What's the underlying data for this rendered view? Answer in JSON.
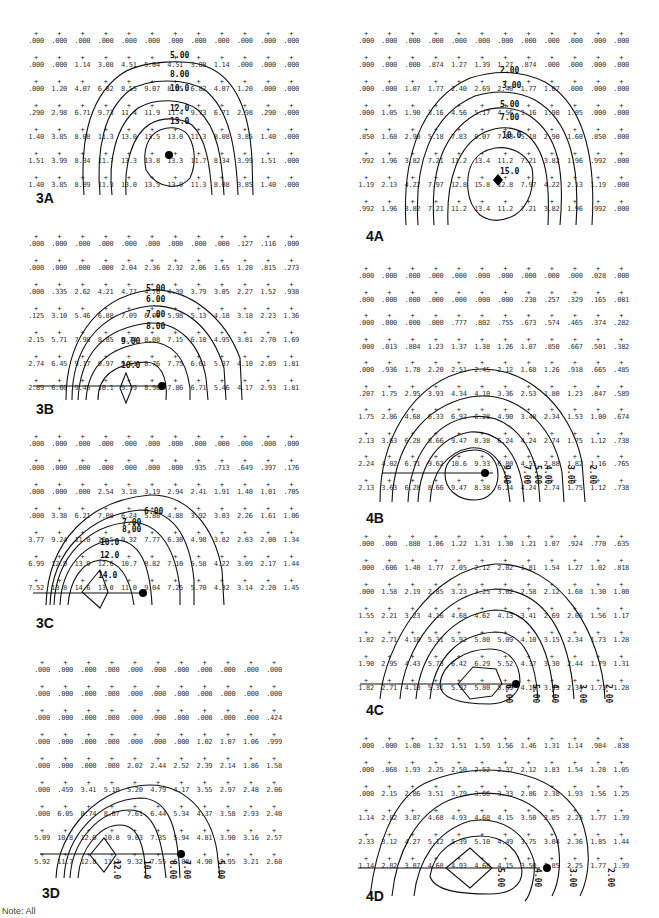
{
  "figure": {
    "footnote": "Note: All"
  },
  "chart_data": [
    {
      "type": "heatmap",
      "id": "3A",
      "title": "3A",
      "contour_levels": [
        "5.00",
        "8.00",
        "10.0",
        "12.0",
        "13.0"
      ],
      "grid": [
        [
          ".000",
          ".000",
          ".000",
          ".000",
          ".000",
          ".000",
          ".000",
          ".000",
          ".000",
          ".000",
          ".000",
          ".000"
        ],
        [
          ".000",
          ".000",
          "1.14",
          "3.08",
          "4.51",
          "5.04",
          "4.51",
          "3.08",
          "1.14",
          ".000",
          ".000",
          ".000"
        ],
        [
          ".000",
          "1.20",
          "4.07",
          "6.82",
          "8.55",
          "9.07",
          "8.55",
          "6.82",
          "4.07",
          "1.20",
          ".000",
          ".000"
        ],
        [
          ".290",
          "2.98",
          "6.71",
          "9.73",
          "11.4",
          "11.9",
          "11.4",
          "9.73",
          "6.71",
          "2.98",
          ".290",
          ".000"
        ],
        [
          "1.40",
          "3.85",
          "8.08",
          "11.3",
          "13.0",
          "13.5",
          "13.0",
          "11.3",
          "8.08",
          "3.85",
          "1.40",
          ".000"
        ],
        [
          "1.51",
          "3.99",
          "8.34",
          "11.7",
          "13.3",
          "13.8",
          "13.3",
          "11.7",
          "8.34",
          "3.99",
          "1.51",
          ".000"
        ],
        [
          "1.40",
          "3.85",
          "8.09",
          "11.3",
          "13.0",
          "13.5",
          "13.0",
          "11.3",
          "8.08",
          "3.85",
          "1.40",
          ".000"
        ]
      ]
    },
    {
      "type": "heatmap",
      "id": "3B",
      "title": "3B",
      "contour_levels": [
        "5.00",
        "6.00",
        "7.00",
        "8.00",
        "9.00",
        "10.0"
      ],
      "grid": [
        [
          ".000",
          ".000",
          ".000",
          ".000",
          ".000",
          ".000",
          ".000",
          ".000",
          ".000",
          ".127",
          ".116",
          ".000"
        ],
        [
          ".000",
          ".000",
          ".000",
          ".000",
          "2.04",
          "2.36",
          "2.32",
          "2.06",
          "1.65",
          "1.20",
          ".815",
          ".273"
        ],
        [
          ".000",
          ".335",
          "2.62",
          "4.21",
          "4.77",
          "4.76",
          "4.39",
          "3.79",
          "3.05",
          "2.27",
          "1.52",
          ".938"
        ],
        [
          ".125",
          "3.10",
          "5.46",
          "6.88",
          "7.09",
          "6.90",
          "5.98",
          "5.13",
          "4.18",
          "3.18",
          "2.23",
          "1.36"
        ],
        [
          "2.15",
          "5.71",
          "7.98",
          "8.85",
          "8.74",
          "8.08",
          "7.15",
          "6.10",
          "4.95",
          "3.81",
          "2.70",
          "1.69"
        ],
        [
          "2.74",
          "6.45",
          "9.17",
          "9.97",
          "9.61",
          "8.76",
          "7.75",
          "6.61",
          "5.37",
          "4.10",
          "2.89",
          "1.81"
        ],
        [
          "2.89",
          "6.60",
          "9.45",
          "10.1",
          "9.79",
          "8.96",
          "7.86",
          "6.71",
          "5.46",
          "4.17",
          "2.93",
          "1.81"
        ]
      ]
    },
    {
      "type": "heatmap",
      "id": "3C",
      "title": "3C",
      "contour_levels": [
        "6.00",
        "7.00",
        "8.00",
        "10.0",
        "12.0",
        "14.0"
      ],
      "grid": [
        [
          ".000",
          ".000",
          ".000",
          ".000",
          ".000",
          ".000",
          ".000",
          ".000",
          ".000",
          ".000",
          ".000",
          ".000"
        ],
        [
          ".000",
          ".000",
          ".000",
          ".000",
          ".000",
          ".000",
          ".000",
          ".935",
          ".713",
          ".649",
          ".397",
          ".176"
        ],
        [
          ".000",
          ".000",
          ".000",
          "2.54",
          "3.18",
          "3.19",
          "2.94",
          "2.41",
          "1.91",
          "1.40",
          "1.01",
          ".705"
        ],
        [
          ".000",
          "3.38",
          "6.21",
          "7.08",
          "6.24",
          "5.88",
          "4.88",
          "3.92",
          "3.03",
          "2.26",
          "1.61",
          "1.06"
        ],
        [
          "3.77",
          "9.24",
          "11.0",
          "10.5",
          "9.32",
          "7.77",
          "6.30",
          "4.98",
          "3.82",
          "2.83",
          "2.00",
          "1.34"
        ],
        [
          "6.99",
          "12.9",
          "13.9",
          "12.6",
          "10.7",
          "8.82",
          "7.10",
          "5.58",
          "4.22",
          "3.09",
          "2.17",
          "1.44"
        ],
        [
          "7.52",
          "13.8",
          "14.6",
          "13.0",
          "11.0",
          "9.04",
          "7.25",
          "5.70",
          "4.32",
          "3.14",
          "2.20",
          "1.45"
        ]
      ]
    },
    {
      "type": "heatmap",
      "id": "3D",
      "title": "3D",
      "contour_levels": [
        "5.00",
        "7.00",
        "8.00",
        "10.0",
        "12.0"
      ],
      "grid": [
        [
          ".000",
          ".000",
          ".000",
          ".000",
          ".000",
          ".000",
          ".000",
          ".000",
          ".000",
          ".000",
          ".000"
        ],
        [
          ".000",
          ".000",
          ".000",
          ".000",
          ".000",
          ".000",
          ".000",
          ".000",
          ".000",
          ".000",
          ".000"
        ],
        [
          ".000",
          ".000",
          ".000",
          ".000",
          ".000",
          ".000",
          ".000",
          ".000",
          ".000",
          ".000",
          ".424"
        ],
        [
          ".000",
          ".000",
          ".000",
          ".000",
          ".000",
          ".000",
          ".000",
          "1.02",
          "1.07",
          "1.06",
          ".999"
        ],
        [
          ".000",
          ".000",
          ".000",
          ".000",
          "2.02",
          "2.44",
          "2.52",
          "2.39",
          "2.14",
          "1.86",
          "1.58"
        ],
        [
          ".000",
          ".459",
          "3.41",
          "5.10",
          "5.20",
          "4.79",
          "4.17",
          "3.55",
          "2.97",
          "2.48",
          "2.06"
        ],
        [
          ".000",
          "6.05",
          "8.74",
          "8.67",
          "7.61",
          "6.44",
          "5.34",
          "4.37",
          "3.58",
          "2.93",
          "2.40"
        ],
        [
          "5.09",
          "10.8",
          "12.0",
          "10.8",
          "9.03",
          "7.35",
          "5.94",
          "4.81",
          "3.90",
          "3.16",
          "2.57"
        ],
        [
          "5.92",
          "11.7",
          "12.8",
          "11.3",
          "9.32",
          "7.55",
          "6.08",
          "4.90",
          "3.95",
          "3.21",
          "2.60"
        ]
      ]
    },
    {
      "type": "heatmap",
      "id": "4A",
      "title": "4A",
      "contour_levels": [
        "2.00",
        "3.00",
        "5.00",
        "7.00",
        "10.0",
        "15.0"
      ],
      "grid": [
        [
          ".000",
          ".000",
          ".000",
          ".000",
          ".000",
          ".000",
          ".000",
          ".000",
          ".000",
          ".000",
          ".000",
          ".000"
        ],
        [
          ".000",
          ".000",
          ".000",
          ".874",
          "1.27",
          "1.39",
          "1.27",
          ".874",
          ".000",
          ".000",
          ".000",
          ".000"
        ],
        [
          ".000",
          ".000",
          "1.07",
          "1.77",
          "2.40",
          "2.69",
          "2.40",
          "1.77",
          "1.07",
          ".000",
          ".000",
          ".000"
        ],
        [
          ".000",
          "1.05",
          "1.90",
          "3.16",
          "4.56",
          "5.17",
          "4.56",
          "3.16",
          "1.90",
          "1.05",
          ".000",
          ".000"
        ],
        [
          ".850",
          "1.60",
          "2.90",
          "5.18",
          "7.83",
          "9.07",
          "7.83",
          "5.18",
          "2.90",
          "1.60",
          ".850",
          ".000"
        ],
        [
          ".992",
          "1.96",
          "3.82",
          "7.21",
          "11.2",
          "13.4",
          "11.2",
          "7.21",
          "3.82",
          "1.96",
          ".992",
          ".000"
        ],
        [
          "1.19",
          "2.13",
          "4.22",
          "7.97",
          "12.8",
          "15.8",
          "12.8",
          "7.97",
          "4.22",
          "2.13",
          "1.19",
          ".000"
        ],
        [
          ".992",
          "1.96",
          "3.82",
          "7.21",
          "11.2",
          "13.4",
          "11.2",
          "7.21",
          "3.82",
          "1.96",
          ".992",
          ".000"
        ]
      ]
    },
    {
      "type": "heatmap",
      "id": "4B",
      "title": "4B",
      "contour_levels": [
        "2.00",
        "3.00",
        "4.00",
        "5.00",
        "7.00",
        "9.00"
      ],
      "grid": [
        [
          ".000",
          ".000",
          ".000",
          ".000",
          ".000",
          ".000",
          ".000",
          ".000",
          ".000",
          ".000",
          ".028",
          ".000"
        ],
        [
          ".000",
          ".000",
          ".000",
          ".000",
          ".000",
          ".000",
          ".000",
          ".238",
          ".257",
          ".329",
          ".165",
          ".081"
        ],
        [
          ".000",
          ".000",
          ".000",
          ".000",
          ".777",
          ".802",
          ".755",
          ".673",
          ".574",
          ".465",
          ".374",
          ".282"
        ],
        [
          ".000",
          ".013",
          ".804",
          "1.23",
          "1.37",
          "1.38",
          "1.26",
          "1.07",
          ".850",
          ".667",
          ".501",
          ".382"
        ],
        [
          ".000",
          ".936",
          "1.78",
          "2.20",
          "2.51",
          "2.45",
          "2.12",
          "1.68",
          "1.26",
          ".918",
          ".665",
          ".485"
        ],
        [
          ".207",
          "1.75",
          "2.95",
          "3.93",
          "4.34",
          "4.10",
          "3.36",
          "2.53",
          "1.80",
          "1.23",
          ".847",
          ".589"
        ],
        [
          "1.75",
          "2.86",
          "4.68",
          "6.33",
          "6.92",
          "6.28",
          "4.90",
          "3.48",
          "2.34",
          "1.53",
          "1.00",
          ".674"
        ],
        [
          "2.13",
          "3.63",
          "6.28",
          "8.66",
          "9.47",
          "8.38",
          "6.24",
          "4.24",
          "2.74",
          "1.75",
          "1.12",
          ".738"
        ],
        [
          "2.24",
          "4.02",
          "6.71",
          "9.62",
          "10.6",
          "9.33",
          "6.80",
          "4.55",
          "2.88",
          "1.82",
          "1.16",
          ".765"
        ],
        [
          "2.13",
          "3.63",
          "6.28",
          "8.66",
          "9.47",
          "8.38",
          "6.24",
          "4.24",
          "2.74",
          "1.75",
          "1.12",
          ".738"
        ]
      ]
    },
    {
      "type": "heatmap",
      "id": "4C",
      "title": "4C",
      "contour_levels": [
        "2.00",
        "3.00",
        "4.00",
        "5.00",
        "6.00"
      ],
      "grid": [
        [
          ".000",
          ".000",
          ".880",
          "1.06",
          "1.22",
          "1.31",
          "1.30",
          "1.21",
          "1.07",
          ".924",
          ".770",
          ".635"
        ],
        [
          ".000",
          ".606",
          "1.40",
          "1.77",
          "2.05",
          "2.12",
          "2.02",
          "1.81",
          "1.54",
          "1.27",
          "1.02",
          ".818"
        ],
        [
          ".000",
          "1.58",
          "2.19",
          "2.85",
          "3.23",
          "3.25",
          "3.02",
          "2.58",
          "2.12",
          "1.68",
          "1.30",
          "1.00"
        ],
        [
          "1.55",
          "2.21",
          "3.23",
          "4.16",
          "4.68",
          "4.62",
          "4.13",
          "3.41",
          "2.69",
          "2.06",
          "1.56",
          "1.17"
        ],
        [
          "1.82",
          "2.71",
          "4.10",
          "5.31",
          "5.92",
          "5.80",
          "5.09",
          "4.10",
          "3.15",
          "2.34",
          "1.73",
          "1.28"
        ],
        [
          "1.90",
          "2.95",
          "4.43",
          "5.73",
          "6.42",
          "6.29",
          "5.52",
          "4.37",
          "3.30",
          "2.44",
          "1.79",
          "1.31"
        ],
        [
          "1.82",
          "2.71",
          "4.10",
          "5.31",
          "5.92",
          "5.80",
          "5.09",
          "4.10",
          "3.15",
          "2.34",
          "1.73",
          "1.28"
        ]
      ]
    },
    {
      "type": "heatmap",
      "id": "4D",
      "title": "4D",
      "contour_levels": [
        "2.00",
        "3.00",
        "4.00",
        "5.00"
      ],
      "grid": [
        [
          ".000",
          ".000",
          "1.08",
          "1.32",
          "1.51",
          "1.59",
          "1.56",
          "1.46",
          "1.31",
          "1.14",
          ".984",
          ".838"
        ],
        [
          ".000",
          ".868",
          "1.93",
          "2.25",
          "2.50",
          "2.52",
          "2.37",
          "2.12",
          "1.83",
          "1.54",
          "1.28",
          "1.05"
        ],
        [
          ".000",
          "2.15",
          "2.86",
          "3.51",
          "3.79",
          "3.66",
          "3.33",
          "2.86",
          "2.38",
          "1.93",
          "1.56",
          "1.25"
        ],
        [
          "1.14",
          "2.82",
          "3.87",
          "4.68",
          "4.93",
          "4.68",
          "4.15",
          "3.50",
          "2.85",
          "2.25",
          "1.77",
          "1.39"
        ],
        [
          "2.33",
          "3.12",
          "4.27",
          "5.12",
          "5.39",
          "5.10",
          "4.49",
          "3.75",
          "3.04",
          "2.36",
          "1.85",
          "1.44"
        ],
        [
          "1.14",
          "2.82",
          "3.87",
          "4.68",
          "4.93",
          "4.68",
          "4.15",
          "3.50",
          "2.85",
          "2.25",
          "1.77",
          "1.39"
        ]
      ]
    }
  ]
}
